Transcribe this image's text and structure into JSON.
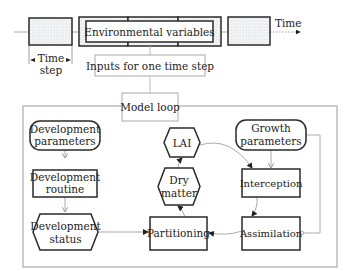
{
  "timeline": {
    "time_label": "Time",
    "time_step_label_line1": "Time",
    "time_step_label_line2": "step",
    "environmental_variables_label": "Environmental variables",
    "inputs_label": "Inputs for one time step"
  },
  "model_loop": {
    "title": "Model loop",
    "nodes": {
      "development_parameters": {
        "line1": "Development",
        "line2": "parameters"
      },
      "development_routine": {
        "line1": "Development",
        "line2": "routine"
      },
      "development_status": {
        "line1": "Development",
        "line2": "status"
      },
      "lai": {
        "line1": "LAI"
      },
      "dry_matter": {
        "line1": "Dry",
        "line2": "matter"
      },
      "partitioning": {
        "line1": "Partitioning"
      },
      "growth_parameters": {
        "line1": "Growth",
        "line2": "parameters"
      },
      "interception": {
        "line1": "Interception"
      },
      "assimilation": {
        "line1": "Assimilation"
      }
    }
  },
  "colors": {
    "stroke_dark": "#2a2a2a",
    "stroke_light": "#9a9a9a",
    "hatch_fill": "#eef0f2",
    "background": "#ffffff"
  }
}
